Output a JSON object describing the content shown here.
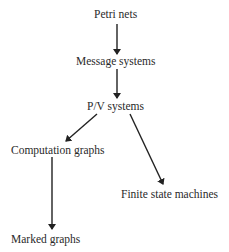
{
  "diagram": {
    "type": "hierarchy",
    "nodes": [
      {
        "id": "petri",
        "label": "Petri nets"
      },
      {
        "id": "message",
        "label": "Message systems"
      },
      {
        "id": "pv",
        "label": "P/V systems"
      },
      {
        "id": "computation",
        "label": "Computation graphs"
      },
      {
        "id": "fsm",
        "label": "Finite state machines"
      },
      {
        "id": "marked",
        "label": "Marked graphs"
      }
    ],
    "edges": [
      {
        "from": "petri",
        "to": "message"
      },
      {
        "from": "message",
        "to": "pv"
      },
      {
        "from": "pv",
        "to": "computation"
      },
      {
        "from": "pv",
        "to": "fsm"
      },
      {
        "from": "computation",
        "to": "marked"
      }
    ],
    "colors": {
      "text": "#2a2a2a",
      "arrow": "#222222",
      "background": "#ffffff"
    }
  }
}
